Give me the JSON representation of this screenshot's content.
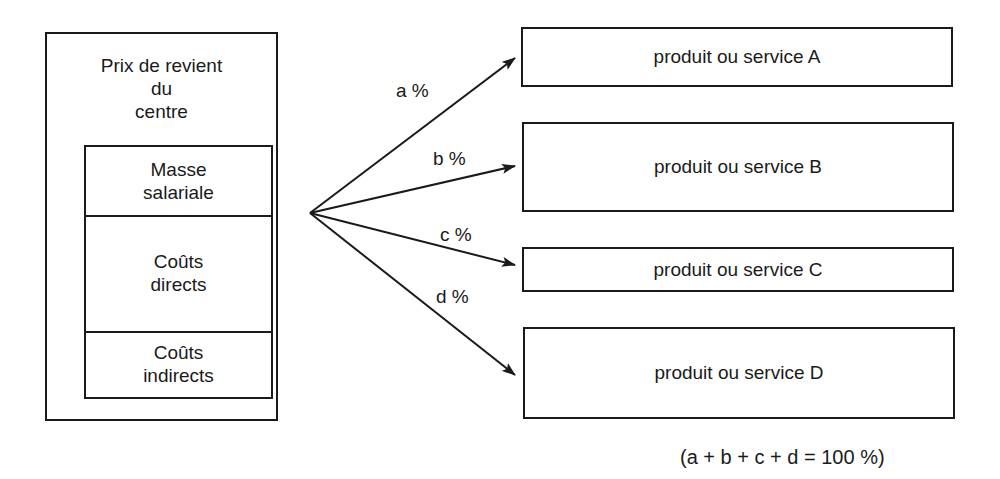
{
  "centre": {
    "title_lines": [
      "Prix de revient",
      "du",
      "centre"
    ],
    "components": [
      {
        "lines": [
          "Masse",
          "salariale"
        ]
      },
      {
        "lines": [
          "Coûts",
          "directs"
        ]
      },
      {
        "lines": [
          "Coûts",
          "indirects"
        ]
      }
    ]
  },
  "allocations": [
    {
      "label": "a %",
      "target": "produit ou service A"
    },
    {
      "label": "b %",
      "target": "produit ou service B"
    },
    {
      "label": "c %",
      "target": "produit ou service C"
    },
    {
      "label": "d %",
      "target": "produit ou service D"
    }
  ],
  "formula": "(a + b + c + d = 100 %)",
  "colors": {
    "stroke": "#1a1a1a",
    "background": "#ffffff"
  }
}
